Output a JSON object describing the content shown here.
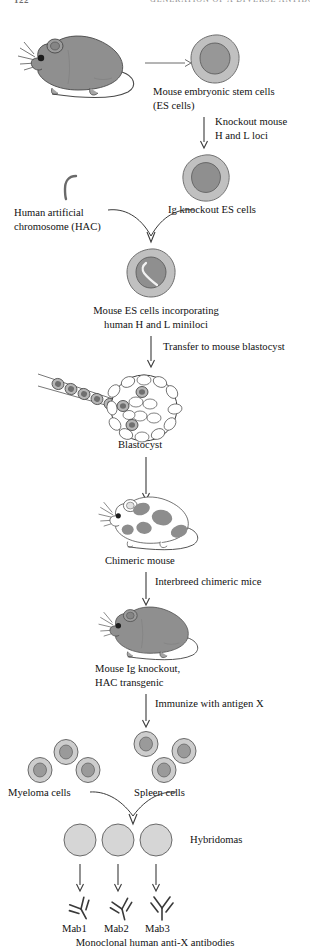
{
  "header": {
    "page_number": "122",
    "running_title": "GENERATION OF A DIVERSE ANTIBODY REPERTOIRE"
  },
  "figure": {
    "steps": [
      {
        "id": "step-1",
        "label": "Mouse embryonic stem cells\n(ES cells)",
        "arrow_label": ""
      },
      {
        "id": "step-2",
        "label": "Ig knockout ES cells",
        "arrow_label": "Knockout mouse\nH and L loci"
      },
      {
        "id": "step-3",
        "label": "Human artificial\nchromosome (HAC)",
        "arrow_label": ""
      },
      {
        "id": "step-4",
        "label": "Mouse ES cells incorporating\nhuman H and L miniloci",
        "arrow_label": ""
      },
      {
        "id": "step-5",
        "label": "Blastocyst",
        "arrow_label": "Transfer to mouse blastocyst"
      },
      {
        "id": "step-6",
        "label": "Chimeric mouse",
        "arrow_label": ""
      },
      {
        "id": "step-7",
        "label": "Mouse Ig knockout,\nHAC transgenic",
        "arrow_label": "Interbreed chimeric mice"
      },
      {
        "id": "step-8",
        "label": "Spleen cells",
        "arrow_label": "Immunize with antigen X"
      },
      {
        "id": "step-9",
        "label": "Myeloma cells",
        "arrow_label": ""
      },
      {
        "id": "step-10",
        "label": "Hybridomas",
        "arrow_label": ""
      }
    ],
    "antibodies": [
      {
        "id": "mab-1",
        "label": "Mab1"
      },
      {
        "id": "mab-2",
        "label": "Mab2"
      },
      {
        "id": "mab-3",
        "label": "Mab3"
      }
    ],
    "caption": "Monoclonal human anti-X antibodies"
  },
  "colors": {
    "cell_cytoplasm": "#c0c0c0",
    "cell_nucleus": "#979797",
    "mouse_body": "#8f8f8f",
    "outline": "#4a4a4a",
    "hybridoma_fill": "#d6d6d6",
    "text": "#111111",
    "arrow": "#3a3a3a"
  }
}
